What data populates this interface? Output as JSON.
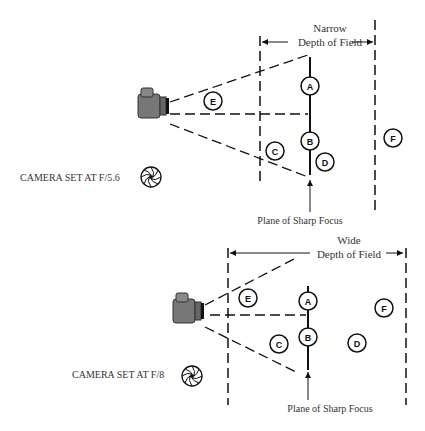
{
  "top": {
    "title_line1": "Narrow",
    "title_line2": "Depth of Field",
    "camera_setting": "CAMERA SET AT F/5.6",
    "plane_label": "Plane of Sharp Focus",
    "points": [
      "A",
      "B",
      "C",
      "D",
      "E",
      "F"
    ]
  },
  "bottom": {
    "title_line1": "Wide",
    "title_line2": "Depth of Field",
    "camera_setting": "CAMERA SET AT F/8",
    "plane_label": "Plane of Sharp Focus",
    "points": [
      "A",
      "B",
      "C",
      "D",
      "E",
      "F"
    ]
  }
}
